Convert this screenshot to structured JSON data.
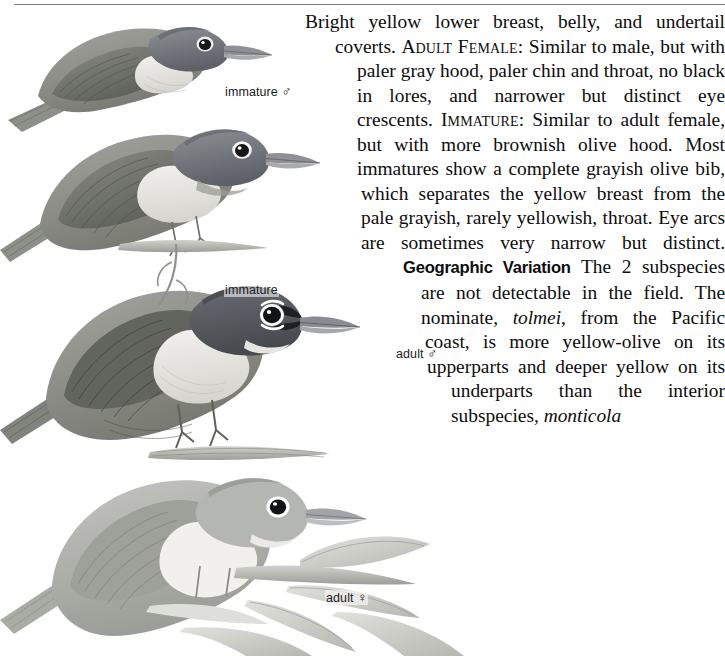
{
  "page": {
    "width": 725,
    "height": 656,
    "background": "#ffffff",
    "rule_color": "#7d7d7d"
  },
  "plate": {
    "title": "MacGillivray's Warbler plumage plate",
    "birds": [
      {
        "id": "immature-male",
        "label": "immature ♂",
        "pose": "perched, head-up, upper left"
      },
      {
        "id": "immature",
        "label": "immature",
        "pose": "perched on twig, upper middle"
      },
      {
        "id": "adult-male",
        "label": "adult ♂",
        "pose": "perched on branch, center"
      },
      {
        "id": "adult-female",
        "label": "adult ♀",
        "pose": "perched on leafy branch, lower"
      }
    ],
    "ink": "#6f7277"
  },
  "captions": {
    "immature_male": "immature",
    "immature_male_symbol": "♂",
    "immature": "immature",
    "adult_male": "adult",
    "adult_male_symbol": "♂",
    "adult_female": "adult",
    "adult_female_symbol": "♀"
  },
  "text": {
    "paragraph_1_part_1": "Bright yellow lower breast, belly, and undertail coverts. ",
    "label_adult_female": "Adult Female:",
    "paragraph_1_part_2": " Similar to male, but with paler gray hood, paler chin and throat, no black in lores, and narrower but distinct eye crescents. ",
    "label_immature": "Immature:",
    "paragraph_1_part_3": " Similar to adult female, but with more brownish olive hood. Most immatures show a complete grayish olive bib, which separates the yellow breast from the pale grayish, rarely yellowish, throat. Eye arcs are sometimes very narrow but distinct.",
    "heading_geographic_variation": "Geographic Variation",
    "paragraph_2_part_1": " The 2 subspecies are not detectable in the field. The nominate, ",
    "subspecies_nominate": "tolmei",
    "paragraph_2_part_2": ", from the Pacific coast, is more yellow-olive on its upperparts and deeper yellow on its underparts than the interior subspecies, ",
    "subspecies_interior": "monticola"
  }
}
